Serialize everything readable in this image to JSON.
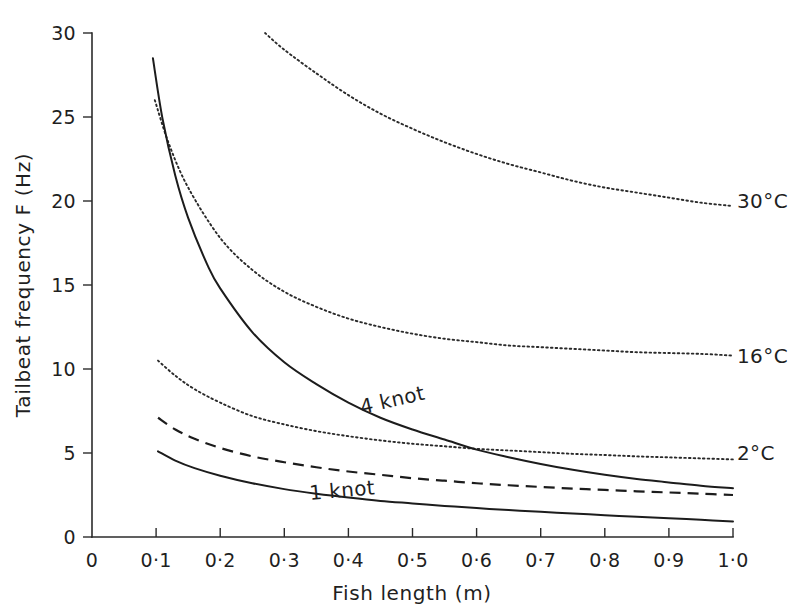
{
  "chart_data": {
    "type": "line",
    "title": "",
    "xlabel": "Fish length (m)",
    "ylabel": "Tailbeat frequency F (Hz)",
    "xlim": [
      0,
      1.0
    ],
    "ylim": [
      0,
      30
    ],
    "grid": false,
    "legend_position": "inline-right-and-on-curve",
    "xticks": [
      0,
      0.1,
      0.2,
      0.3,
      0.4,
      0.5,
      0.6,
      0.7,
      0.8,
      0.9,
      1.0
    ],
    "xtick_labels": [
      "0",
      "0·1",
      "0·2",
      "0·3",
      "0·4",
      "0·5",
      "0·6",
      "0·7",
      "0·8",
      "0·9",
      "1·0"
    ],
    "yticks": [
      0,
      5,
      10,
      15,
      20,
      25,
      30
    ],
    "ytick_labels": [
      "0",
      "5",
      "10",
      "15",
      "20",
      "25",
      "30"
    ],
    "series": [
      {
        "name": "30°C",
        "label": "30°C",
        "style": "dotted",
        "label_position": "right",
        "x": [
          0.27,
          0.3,
          0.35,
          0.4,
          0.45,
          0.5,
          0.55,
          0.6,
          0.65,
          0.7,
          0.75,
          0.8,
          0.85,
          0.9,
          0.95,
          1.0
        ],
        "y": [
          30.0,
          29.0,
          27.6,
          26.3,
          25.2,
          24.3,
          23.5,
          22.8,
          22.2,
          21.7,
          21.2,
          20.8,
          20.5,
          20.2,
          19.9,
          19.7
        ]
      },
      {
        "name": "16°C",
        "label": "16°C",
        "style": "dotted",
        "label_position": "right",
        "x": [
          0.098,
          0.12,
          0.15,
          0.2,
          0.25,
          0.3,
          0.35,
          0.4,
          0.45,
          0.5,
          0.55,
          0.6,
          0.65,
          0.7,
          0.75,
          0.8,
          0.85,
          0.9,
          0.95,
          1.0
        ],
        "y": [
          26.0,
          23.4,
          20.8,
          17.8,
          15.9,
          14.6,
          13.7,
          13.0,
          12.5,
          12.1,
          11.8,
          11.6,
          11.4,
          11.3,
          11.2,
          11.1,
          11.0,
          10.95,
          10.9,
          10.8
        ]
      },
      {
        "name": "2°C",
        "label": "2°C",
        "style": "dotted",
        "label_position": "right",
        "x": [
          0.103,
          0.13,
          0.16,
          0.2,
          0.25,
          0.3,
          0.35,
          0.4,
          0.45,
          0.5,
          0.55,
          0.6,
          0.65,
          0.7,
          0.75,
          0.8,
          0.85,
          0.9,
          0.95,
          1.0
        ],
        "y": [
          10.5,
          9.6,
          8.8,
          8.0,
          7.2,
          6.7,
          6.3,
          6.0,
          5.75,
          5.55,
          5.4,
          5.25,
          5.15,
          5.05,
          4.95,
          4.88,
          4.8,
          4.74,
          4.68,
          4.62
        ]
      },
      {
        "name": "4 knot",
        "label": "4 knot",
        "style": "solid",
        "label_position": "on-curve",
        "x": [
          0.095,
          0.11,
          0.13,
          0.15,
          0.18,
          0.2,
          0.25,
          0.3,
          0.35,
          0.4,
          0.45,
          0.5,
          0.55,
          0.6,
          0.65,
          0.7,
          0.75,
          0.8,
          0.85,
          0.9,
          0.95,
          1.0
        ],
        "y": [
          28.5,
          24.9,
          21.5,
          19.0,
          16.2,
          14.8,
          12.2,
          10.4,
          9.1,
          8.0,
          7.1,
          6.4,
          5.8,
          5.2,
          4.75,
          4.35,
          4.0,
          3.7,
          3.45,
          3.25,
          3.05,
          2.9
        ]
      },
      {
        "name": "2 knot",
        "label": "",
        "style": "dashed",
        "label_position": "none",
        "x": [
          0.103,
          0.13,
          0.16,
          0.2,
          0.25,
          0.3,
          0.35,
          0.4,
          0.45,
          0.5,
          0.55,
          0.6,
          0.65,
          0.7,
          0.75,
          0.8,
          0.85,
          0.9,
          0.95,
          1.0
        ],
        "y": [
          7.1,
          6.4,
          5.85,
          5.3,
          4.8,
          4.45,
          4.15,
          3.9,
          3.7,
          3.5,
          3.35,
          3.2,
          3.08,
          2.98,
          2.88,
          2.8,
          2.72,
          2.65,
          2.58,
          2.5
        ]
      },
      {
        "name": "1 knot",
        "label": "1 knot",
        "style": "solid",
        "label_position": "on-curve",
        "x": [
          0.103,
          0.13,
          0.16,
          0.2,
          0.25,
          0.3,
          0.35,
          0.4,
          0.45,
          0.5,
          0.55,
          0.6,
          0.65,
          0.7,
          0.75,
          0.8,
          0.85,
          0.9,
          0.95,
          1.0
        ],
        "y": [
          5.1,
          4.55,
          4.1,
          3.65,
          3.2,
          2.85,
          2.58,
          2.35,
          2.15,
          2.0,
          1.85,
          1.72,
          1.6,
          1.5,
          1.4,
          1.3,
          1.2,
          1.12,
          1.02,
          0.92
        ]
      }
    ],
    "annotations": [
      {
        "text": "30°C",
        "x": 1.0,
        "y": 19.7
      },
      {
        "text": "16°C",
        "x": 1.0,
        "y": 10.8
      },
      {
        "text": "2°C",
        "x": 1.0,
        "y": 4.62
      },
      {
        "text": "4 knot",
        "x": 0.41,
        "y": 7.9
      },
      {
        "text": "1 knot",
        "x": 0.34,
        "y": 2.55
      }
    ]
  },
  "axes": {
    "x_title": "Fish length (m)",
    "y_title": "Tailbeat frequency F (Hz)"
  },
  "labels": {
    "t30": "30°C",
    "t16": "16°C",
    "t2": "2°C",
    "knot4": "4 knot",
    "knot1": "1 knot"
  },
  "colors": {
    "axis": "#2b2b2b",
    "curve": "#1c1c1c",
    "background": "#ffffff"
  }
}
